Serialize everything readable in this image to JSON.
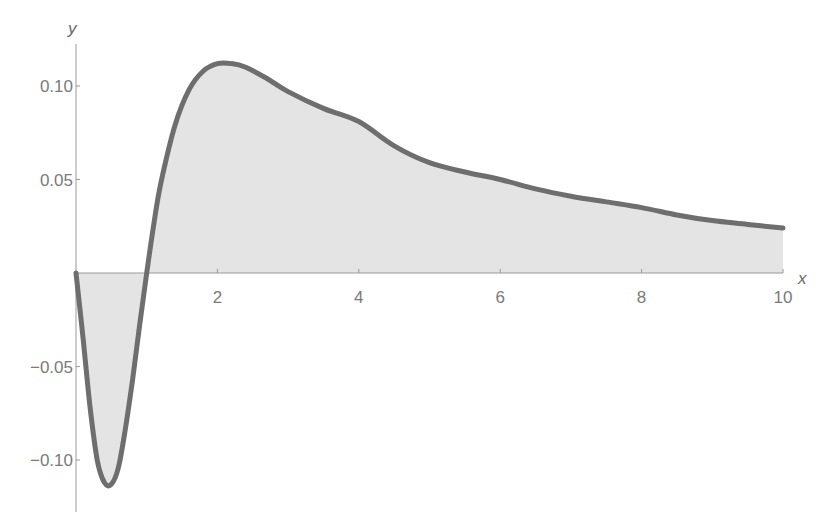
{
  "chart_data": {
    "type": "area",
    "title": "",
    "xlabel": "x",
    "ylabel": "y",
    "xlim": [
      0,
      10
    ],
    "ylim": [
      -0.125,
      0.125
    ],
    "grid": false,
    "legend": null,
    "x_ticks": [
      2,
      4,
      6,
      8,
      10
    ],
    "x_tick_labels": [
      "2",
      "4",
      "6",
      "8",
      "10"
    ],
    "y_ticks": [
      -0.1,
      -0.05,
      0.05,
      0.1
    ],
    "y_tick_labels": [
      "-0.10",
      "-0.05",
      "0.05",
      "0.10"
    ],
    "fill": "to-axis",
    "colors": {
      "line": "#6e6e6e",
      "fill": "#e4e4e4",
      "axis": "#9a9a9a",
      "text": "#7a7a7a"
    },
    "series": [
      {
        "name": "f(x)",
        "x": [
          0,
          0.1,
          0.2,
          0.3,
          0.4,
          0.5,
          0.6,
          0.7,
          0.8,
          0.9,
          1.0,
          1.1,
          1.2,
          1.4,
          1.6,
          1.8,
          2.0,
          2.2,
          2.4,
          2.7,
          3.0,
          3.5,
          4.0,
          4.5,
          5.0,
          5.5,
          6.0,
          6.5,
          7.0,
          7.5,
          8.0,
          8.5,
          9.0,
          9.5,
          10.0
        ],
        "y": [
          0,
          -0.035,
          -0.072,
          -0.1,
          -0.112,
          -0.113,
          -0.104,
          -0.083,
          -0.057,
          -0.028,
          0,
          0.026,
          0.048,
          0.079,
          0.098,
          0.108,
          0.112,
          0.112,
          0.11,
          0.104,
          0.097,
          0.088,
          0.081,
          0.068,
          0.059,
          0.054,
          0.05,
          0.045,
          0.041,
          0.038,
          0.035,
          0.031,
          0.028,
          0.026,
          0.024
        ]
      }
    ]
  }
}
